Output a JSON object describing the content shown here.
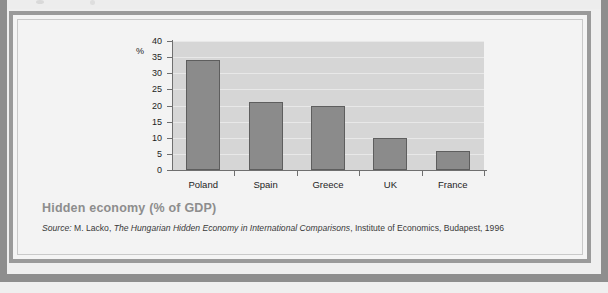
{
  "figure": {
    "title": "Hidden economy (% of GDP)",
    "source_prefix": "Source:",
    "source_author": " M. Lacko, ",
    "source_work": "The Hungarian Hidden Economy in International Comparisons",
    "source_rest": ", Institute of Economics, Budapest, 1996"
  },
  "chart_data": {
    "type": "bar",
    "title": "Hidden economy (% of GDP)",
    "categories": [
      "Poland",
      "Spain",
      "Greece",
      "UK",
      "France"
    ],
    "values": [
      34,
      21,
      20,
      10,
      6
    ],
    "xlabel": "",
    "ylabel": "%",
    "ylim": [
      0,
      40
    ],
    "yticks": [
      0,
      5,
      10,
      15,
      20,
      25,
      30,
      35,
      40
    ],
    "ytick_labels": [
      "0",
      "5",
      "10",
      "15",
      "20",
      "25",
      "30",
      "35",
      "40"
    ],
    "unit_label": "%",
    "grid": true,
    "legend": "none",
    "colors": {
      "bar_fill": "#8b8b8b",
      "bar_edge": "#5e5e5e",
      "plot_background": "#d6d6d6",
      "gridline": "#e8e8e8",
      "axis": "#6f6f6f",
      "title_text": "#8d8d8d"
    }
  }
}
